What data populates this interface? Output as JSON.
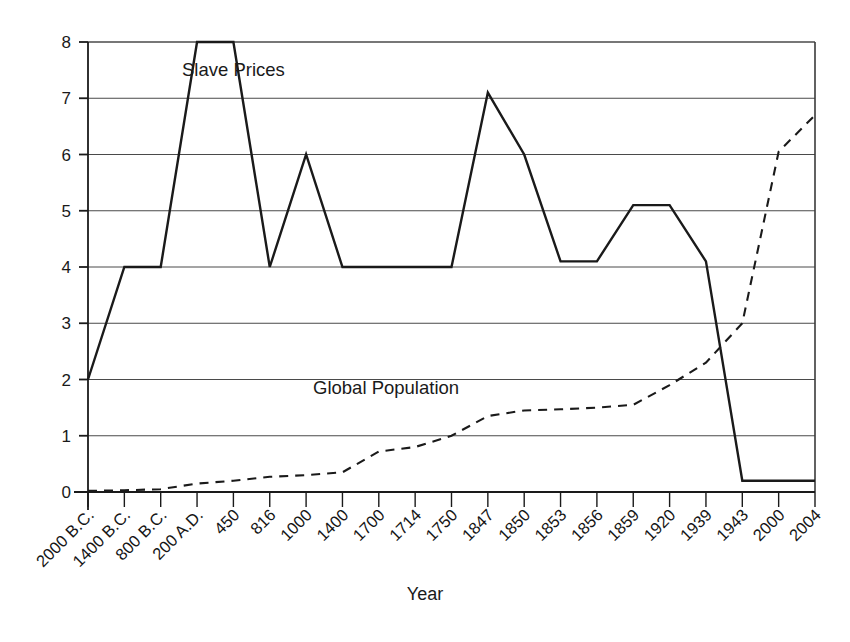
{
  "chart_data": {
    "type": "line",
    "title": "",
    "xlabel": "Year",
    "ylabel": "",
    "ylim": [
      0,
      8
    ],
    "grid": true,
    "legend_position": "inline-annotation",
    "categories": [
      "2000 B.C.",
      "1400 B.C.",
      "800 B.C.",
      "200 A.D.",
      "450",
      "816",
      "1000",
      "1400",
      "1700",
      "1714",
      "1750",
      "1847",
      "1850",
      "1853",
      "1856",
      "1859",
      "1920",
      "1939",
      "1943",
      "2000",
      "2004"
    ],
    "y_ticks": [
      "0",
      "1",
      "2",
      "3",
      "4",
      "5",
      "6",
      "7",
      "8"
    ],
    "series": [
      {
        "name": "Slave Prices",
        "style": "solid",
        "color": "#1a1a1a",
        "values": [
          2,
          4,
          4,
          8,
          8,
          4,
          6,
          4,
          4,
          4,
          4,
          7.1,
          6,
          4.1,
          4.1,
          5.1,
          5.1,
          4.1,
          0.2,
          0.2,
          0.2
        ]
      },
      {
        "name": "Global Population",
        "style": "dashed",
        "color": "#1a1a1a",
        "values": [
          0.02,
          0.03,
          0.05,
          0.15,
          0.2,
          0.27,
          0.3,
          0.35,
          0.72,
          0.8,
          1.0,
          1.35,
          1.45,
          1.47,
          1.5,
          1.55,
          1.9,
          2.3,
          3.0,
          6.05,
          6.7
        ]
      }
    ],
    "annotations": [
      {
        "text": "Slave Prices",
        "x_index": 4,
        "y_value": 7.4
      },
      {
        "text": "Global Population",
        "x_index": 8.2,
        "y_value": 1.75
      }
    ]
  }
}
